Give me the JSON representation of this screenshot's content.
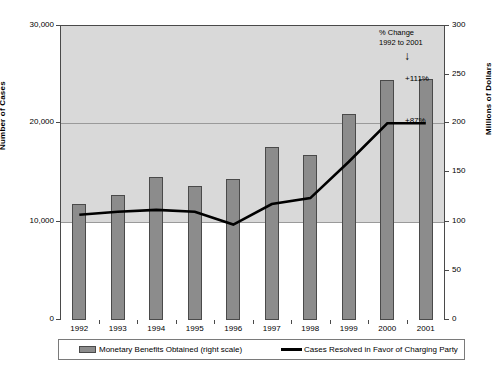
{
  "chart_data": {
    "type": "bar",
    "title": "",
    "subtitle": "",
    "xlabel": "",
    "ylabel": "Number of Cases",
    "y2label": "Millions of Dollars",
    "categories": [
      "1992",
      "1993",
      "1994",
      "1995",
      "1996",
      "1997",
      "1998",
      "1999",
      "2000",
      "2001"
    ],
    "grid": true,
    "legend_position": "bottom",
    "ylim": [
      0,
      30000
    ],
    "yticks": [
      "0",
      "10,000",
      "20,000",
      "30,000"
    ],
    "ytick_values": [
      0,
      10000,
      20000,
      30000
    ],
    "y2lim": [
      0,
      300
    ],
    "y2ticks": [
      "0",
      "50",
      "100",
      "150",
      "200",
      "250",
      "300"
    ],
    "y2tick_values": [
      0,
      50,
      100,
      150,
      200,
      250,
      300
    ],
    "series": [
      {
        "name": "Monetary Benefits Obtained (right scale)",
        "type": "bar",
        "axis": "right",
        "units": "Millions of Dollars",
        "color": "#8c8c8c",
        "values": [
          118,
          127,
          145,
          136,
          143,
          176,
          168,
          210,
          244,
          245
        ]
      },
      {
        "name": "Cases Resolved in Favor of Charging Party",
        "type": "line",
        "axis": "right",
        "units": "Millions of Dollars",
        "color": "#000000",
        "values": [
          107,
          110,
          112,
          110,
          97,
          118,
          124,
          161,
          200,
          200
        ]
      }
    ],
    "annotations": [
      {
        "text": "% Change",
        "role": "annotation-title-line1"
      },
      {
        "text": "1992 to 2001",
        "role": "annotation-title-line2"
      },
      {
        "text": "+111%",
        "role": "bar-change-label"
      },
      {
        "text": "+87%",
        "role": "line-change-label"
      }
    ]
  },
  "legend": {
    "bar_label": "Monetary Benefits Obtained (right scale)",
    "line_label": "Cases Resolved in Favor of Charging Party"
  },
  "axes": {
    "left_title": "Number of Cases",
    "right_title": "Millions of Dollars",
    "left_ticks": [
      "30,000",
      "20,000",
      "10,000",
      "0"
    ],
    "right_ticks": [
      "300",
      "250",
      "200",
      "150",
      "100",
      "50",
      "0"
    ],
    "x_ticks": [
      "1992",
      "1993",
      "1994",
      "1995",
      "1996",
      "1997",
      "1998",
      "1999",
      "2000",
      "2001"
    ]
  },
  "annotation": {
    "line1": "% Change",
    "line2": "1992 to 2001",
    "arrow": "↓",
    "bar_pct": "+111%",
    "line_pct": "+87%"
  },
  "colors": {
    "bar_fill": "#8c8c8c",
    "bar_stroke": "#4a4a4a",
    "line": "#000000",
    "plot_shade": "#d9d9d9",
    "grid": "#9a9a9a",
    "frame": "#4a4a4a"
  }
}
